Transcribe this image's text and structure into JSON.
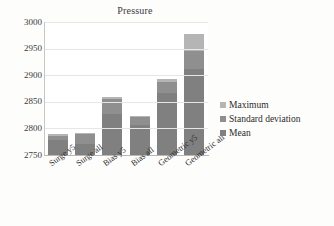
{
  "chart_data": {
    "type": "bar",
    "title": "Pressure",
    "xlabel": "",
    "ylabel": "",
    "stacked": true,
    "grid": true,
    "legend_position": "right",
    "ylim": [
      2750,
      3000
    ],
    "yticks": [
      2750,
      2800,
      2850,
      2900,
      2950,
      3000
    ],
    "ytick_labels": [
      "2750",
      "2800",
      "2850",
      "2900",
      "2950",
      "3000"
    ],
    "categories": [
      "Surge y5",
      "Surge all",
      "Bias y5",
      "Bias all",
      "Geometric y5",
      "Geometric all"
    ],
    "series": [
      {
        "name": "Mean",
        "color": "#808080",
        "values": [
          2779,
          2770,
          2827,
          2807,
          2867,
          2912
        ]
      },
      {
        "name": "Standard deviation",
        "color": "#8f8f8f",
        "values": [
          2786,
          2790,
          2856,
          2821,
          2888,
          2945
        ]
      },
      {
        "name": "Maximum",
        "color": "#b5b5b5",
        "values": [
          2790,
          2791,
          2859,
          2823,
          2892,
          2977
        ]
      }
    ],
    "legend_entries": [
      "Maximum",
      "Standard deviation",
      "Mean"
    ]
  },
  "colors": {
    "mean": "#808080",
    "standard_deviation": "#8f8f8f",
    "maximum": "#b5b5b5",
    "gridline": "#e8e6e2",
    "axis": "#b9b7b3",
    "plot_background": "#ffffff",
    "page_background": "#fdfdfc",
    "text": "#2b2b2b"
  }
}
